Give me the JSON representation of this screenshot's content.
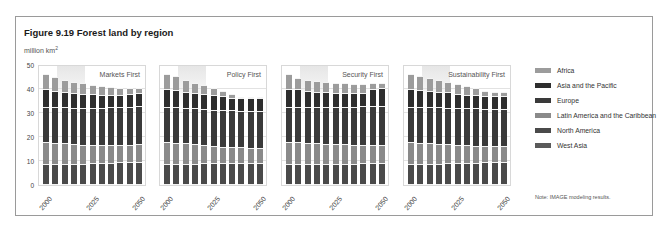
{
  "figure": {
    "title": "Figure 9.19 Forest land by region",
    "unit_prefix": "million km",
    "unit_sup": "2",
    "note": "Note: IMAGE modeling results."
  },
  "colors": {
    "Africa": "#9c9c9c",
    "Asia and the Pacific": "#2e2e2e",
    "Europe": "#3a3a3a",
    "Latin America and the Caribbean": "#8a8a8a",
    "North America": "#4a4a4a",
    "West Asia": "#5a5a5a"
  },
  "legend": [
    {
      "label": "Africa",
      "color": "#9c9c9c"
    },
    {
      "label": "Asia and the Pacific",
      "color": "#2e2e2e"
    },
    {
      "label": "Europe",
      "color": "#3a3a3a"
    },
    {
      "label": "Latin America and the Caribbean",
      "color": "#8a8a8a"
    },
    {
      "label": "North America",
      "color": "#4a4a4a"
    },
    {
      "label": "West Asia",
      "color": "#5a5a5a"
    }
  ],
  "chart_data": {
    "type": "bar",
    "stacked": true,
    "title": "Figure 9.19 Forest land by region",
    "ylabel": "million km²",
    "ylim": [
      0,
      50
    ],
    "yticks": [
      0,
      10,
      20,
      30,
      40,
      50
    ],
    "grid": true,
    "legend_position": "right",
    "x": [
      2000,
      2005,
      2010,
      2015,
      2020,
      2025,
      2030,
      2035,
      2040,
      2045,
      2050
    ],
    "xtick_labels": [
      "2000",
      "2025",
      "2050"
    ],
    "stack_order_bottom_to_top": [
      "West Asia",
      "North America",
      "Latin America and the Caribbean",
      "Europe",
      "Asia and the Pacific",
      "Africa"
    ],
    "panels": [
      {
        "name": "Markets First",
        "series": [
          {
            "name": "West Asia",
            "values": [
              0.3,
              0.3,
              0.3,
              0.3,
              0.3,
              0.3,
              0.3,
              0.3,
              0.3,
              0.3,
              0.3
            ]
          },
          {
            "name": "North America",
            "values": [
              8.2,
              8.2,
              8.3,
              8.4,
              8.5,
              8.6,
              8.7,
              8.8,
              9.0,
              9.1,
              9.2
            ]
          },
          {
            "name": "Latin America and the Caribbean",
            "values": [
              9.5,
              9.0,
              8.6,
              8.2,
              7.9,
              7.7,
              7.5,
              7.4,
              7.3,
              7.3,
              7.3
            ]
          },
          {
            "name": "Europe",
            "values": [
              14.6,
              14.8,
              15.0,
              15.2,
              15.4,
              15.5,
              15.6,
              15.7,
              15.8,
              15.9,
              16.0
            ]
          },
          {
            "name": "Asia and the Pacific",
            "values": [
              7.4,
              6.9,
              6.3,
              6.1,
              5.8,
              5.6,
              5.4,
              5.2,
              5.1,
              5.2,
              5.4
            ]
          },
          {
            "name": "Africa",
            "values": [
              6.0,
              5.8,
              5.2,
              4.8,
              4.4,
              4.0,
              3.6,
              3.4,
              3.0,
              2.7,
              2.3
            ]
          }
        ],
        "totals": [
          46,
          45,
          43.7,
          43,
          42.3,
          41.7,
          41.1,
          40.8,
          40.5,
          40.5,
          40.5
        ]
      },
      {
        "name": "Policy First",
        "series": [
          {
            "name": "West Asia",
            "values": [
              0.3,
              0.3,
              0.3,
              0.3,
              0.3,
              0.3,
              0.3,
              0.3,
              0.3,
              0.3,
              0.3
            ]
          },
          {
            "name": "North America",
            "values": [
              8.2,
              8.3,
              8.4,
              8.5,
              8.6,
              8.6,
              8.7,
              8.7,
              8.8,
              8.8,
              8.9
            ]
          },
          {
            "name": "Latin America and the Caribbean",
            "values": [
              9.5,
              9.0,
              8.5,
              8.0,
              7.6,
              7.2,
              6.9,
              6.7,
              6.5,
              6.3,
              6.2
            ]
          },
          {
            "name": "Europe",
            "values": [
              14.6,
              14.7,
              14.9,
              15.0,
              15.1,
              15.2,
              15.2,
              15.3,
              15.3,
              15.4,
              15.4
            ]
          },
          {
            "name": "Asia and the Pacific",
            "values": [
              7.4,
              7.0,
              6.6,
              6.4,
              6.2,
              6.0,
              5.7,
              5.3,
              5.2,
              5.3,
              5.4
            ]
          },
          {
            "name": "Africa",
            "values": [
              6.0,
              5.9,
              5.0,
              4.3,
              3.6,
              3.0,
              2.2,
              1.4,
              0.5,
              0.0,
              0.0
            ]
          }
        ],
        "totals": [
          46,
          45.2,
          43.7,
          42.5,
          41.4,
          40.3,
          39.0,
          37.7,
          36.6,
          36.1,
          36.2
        ]
      },
      {
        "name": "Security First",
        "series": [
          {
            "name": "West Asia",
            "values": [
              0.3,
              0.3,
              0.3,
              0.3,
              0.3,
              0.3,
              0.3,
              0.3,
              0.3,
              0.3,
              0.3
            ]
          },
          {
            "name": "North America",
            "values": [
              8.2,
              8.2,
              8.3,
              8.3,
              8.4,
              8.4,
              8.5,
              8.5,
              8.6,
              8.6,
              8.7
            ]
          },
          {
            "name": "Latin America and the Caribbean",
            "values": [
              9.5,
              9.2,
              8.9,
              8.7,
              8.4,
              8.2,
              8.1,
              7.9,
              7.8,
              7.7,
              7.6
            ]
          },
          {
            "name": "Europe",
            "values": [
              14.6,
              14.8,
              15.0,
              15.2,
              15.4,
              15.6,
              15.7,
              15.9,
              16.0,
              16.1,
              16.2
            ]
          },
          {
            "name": "Asia and the Pacific",
            "values": [
              7.4,
              7.2,
              6.4,
              6.2,
              6.1,
              5.9,
              5.8,
              5.8,
              5.7,
              7.0,
              7.6
            ]
          },
          {
            "name": "Africa",
            "values": [
              6.0,
              4.8,
              4.7,
              4.5,
              4.2,
              4.0,
              3.8,
              3.7,
              3.5,
              2.5,
              2.0
            ]
          }
        ],
        "totals": [
          46,
          44.5,
          43.6,
          43.2,
          42.8,
          42.4,
          42.2,
          42.1,
          41.9,
          42.2,
          42.4
        ]
      },
      {
        "name": "Sustainability First",
        "series": [
          {
            "name": "West Asia",
            "values": [
              0.3,
              0.3,
              0.3,
              0.3,
              0.3,
              0.3,
              0.3,
              0.3,
              0.3,
              0.3,
              0.3
            ]
          },
          {
            "name": "North America",
            "values": [
              8.2,
              8.3,
              8.4,
              8.5,
              8.6,
              8.7,
              8.8,
              8.9,
              9.0,
              9.1,
              9.2
            ]
          },
          {
            "name": "Latin America and the Caribbean",
            "values": [
              9.5,
              9.0,
              8.6,
              8.2,
              7.9,
              7.6,
              7.3,
              7.0,
              6.8,
              6.6,
              6.5
            ]
          },
          {
            "name": "Europe",
            "values": [
              14.6,
              14.8,
              15.0,
              15.2,
              15.3,
              15.4,
              15.5,
              15.6,
              15.6,
              15.7,
              15.7
            ]
          },
          {
            "name": "Asia and the Pacific",
            "values": [
              7.4,
              7.1,
              6.8,
              6.6,
              6.4,
              6.0,
              5.6,
              5.4,
              5.3,
              5.3,
              5.3
            ]
          },
          {
            "name": "Africa",
            "values": [
              6.0,
              5.9,
              5.2,
              4.8,
              4.3,
              4.0,
              3.8,
              3.0,
              2.0,
              1.8,
              1.7
            ]
          }
        ],
        "totals": [
          46,
          45.4,
          44.3,
          43.6,
          42.8,
          42.0,
          41.3,
          40.2,
          39.0,
          38.8,
          38.7
        ]
      }
    ]
  },
  "panels": [
    {
      "label": "Markets First"
    },
    {
      "label": "Policy First"
    },
    {
      "label": "Security First"
    },
    {
      "label": "Sustainability First"
    }
  ],
  "yticks": [
    "0",
    "10",
    "20",
    "30",
    "40",
    "50"
  ],
  "xlabels": [
    "2000",
    "2025",
    "2050"
  ]
}
